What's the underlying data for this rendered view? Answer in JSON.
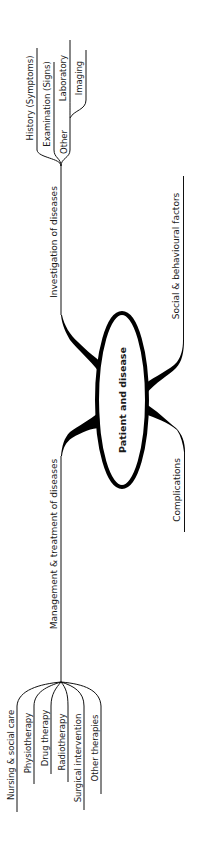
{
  "diagram": {
    "type": "mind-map",
    "orientation": "rotated-90-ccw",
    "center": {
      "label": "Patient and disease"
    },
    "branches": [
      {
        "label": "Investigation of diseases",
        "children": [
          {
            "label": "History (Symptoms)"
          },
          {
            "label": "Examination (Signs)"
          },
          {
            "label": "Other",
            "children": [
              {
                "label": "Laboratory"
              },
              {
                "label": "Imaging"
              }
            ]
          }
        ]
      },
      {
        "label": "Social & behavioural factors",
        "children": []
      },
      {
        "label": "Complications",
        "children": []
      },
      {
        "label": "Management & treatment of diseases",
        "children": [
          {
            "label": "Nursing & social care"
          },
          {
            "label": "Physiotherapy"
          },
          {
            "label": "Drug therapy"
          },
          {
            "label": "Radiotherapy"
          },
          {
            "label": "Surgical intervention"
          },
          {
            "label": "Other therapies"
          }
        ]
      }
    ]
  },
  "colors": {
    "line": "#111111",
    "text": "#1a1a1a",
    "background": "#ffffff"
  }
}
